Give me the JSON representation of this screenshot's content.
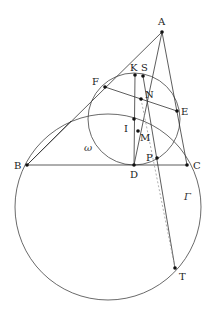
{
  "diagram": {
    "type": "geometry",
    "colors": {
      "line": "#333333",
      "circle": "#444444",
      "dashed": "#9a9a9a",
      "point": "#111111",
      "text": "#222222"
    },
    "points": [
      {
        "id": "A",
        "label": "A",
        "x": 162,
        "y": 32,
        "lx": 158,
        "ly": 25
      },
      {
        "id": "B",
        "label": "B",
        "x": 27,
        "y": 165,
        "lx": 14,
        "ly": 169
      },
      {
        "id": "C",
        "label": "C",
        "x": 187,
        "y": 165,
        "lx": 193,
        "ly": 169
      },
      {
        "id": "D",
        "label": "D",
        "x": 134,
        "y": 165,
        "lx": 130,
        "ly": 178
      },
      {
        "id": "E",
        "label": "E",
        "x": 177,
        "y": 111,
        "lx": 181,
        "ly": 115
      },
      {
        "id": "F",
        "label": "F",
        "x": 105,
        "y": 87,
        "lx": 92,
        "ly": 85
      },
      {
        "id": "K",
        "label": "K",
        "x": 135,
        "y": 75,
        "lx": 130,
        "ly": 71
      },
      {
        "id": "S",
        "label": "S",
        "x": 143,
        "y": 76,
        "lx": 141,
        "ly": 71
      },
      {
        "id": "N",
        "label": "N",
        "x": 141,
        "y": 99,
        "lx": 145,
        "ly": 98
      },
      {
        "id": "I",
        "label": "I",
        "x": 134,
        "y": 119,
        "lx": 124,
        "ly": 132
      },
      {
        "id": "M",
        "label": "M",
        "x": 138,
        "y": 131,
        "lx": 140,
        "ly": 141
      },
      {
        "id": "P",
        "label": "P",
        "x": 157,
        "y": 158,
        "lx": 146,
        "ly": 161
      },
      {
        "id": "T",
        "label": "T",
        "x": 175,
        "y": 268,
        "lx": 179,
        "ly": 280
      }
    ],
    "segments": [
      {
        "from": "A",
        "to": "B",
        "style": "solid"
      },
      {
        "from": "A",
        "to": "C",
        "style": "solid"
      },
      {
        "from": "B",
        "to": "C",
        "style": "solid"
      },
      {
        "from": "F",
        "to": "E",
        "style": "solid"
      },
      {
        "from": "K",
        "to": "D",
        "style": "solid"
      },
      {
        "from": "A",
        "to": "D",
        "style": "solid"
      },
      {
        "from": "S",
        "to": "T",
        "style": "solid"
      },
      {
        "from": "N",
        "to": "T",
        "style": "dashed"
      },
      {
        "from": "B",
        "to": "N_ext",
        "style": "solid"
      }
    ],
    "circles": [
      {
        "id": "omega",
        "label": "ω",
        "cx": 134,
        "cy": 119,
        "r": 46,
        "lx": 84,
        "ly": 151
      },
      {
        "id": "Gamma",
        "label": "Γ",
        "cx": 108,
        "cy": 207,
        "r": 93,
        "lx": 184,
        "ly": 200
      }
    ]
  }
}
